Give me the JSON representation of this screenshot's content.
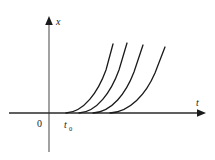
{
  "figure": {
    "title": "",
    "background_color": "#ffffff",
    "axis_color": "#7a7a7a",
    "curve_color": "#1a1a1a",
    "label_color": "#1a1a1a"
  },
  "axes": {
    "vertical": {
      "name": "x-axis",
      "label": "x",
      "arrow": "up-arrow-icon",
      "x_px": 49,
      "y_top_px": 18,
      "y_bottom_px": 152
    },
    "horizontal": {
      "name": "t-axis",
      "label": "t",
      "arrow": "right-arrow-icon",
      "y_px": 113,
      "x_left_px": 9,
      "x_right_px": 205
    },
    "origin": {
      "label": "0",
      "x_px": 40,
      "y_px": 126
    },
    "marker": {
      "label": "t",
      "subscript": "0",
      "x_px": 66,
      "y_px": 127
    }
  },
  "chart_data": {
    "type": "line",
    "title": "",
    "xlabel": "t",
    "ylabel": "x",
    "grid": false,
    "legend": null,
    "xlim": [
      0,
      10
    ],
    "ylim": [
      0,
      10
    ],
    "annotations": [
      {
        "text": "0",
        "role": "origin"
      },
      {
        "text": "t0",
        "role": "threshold-time"
      }
    ],
    "series": [
      {
        "name": "curve-1",
        "start_t_px": 66,
        "path": "M 66,113 C 84,112 98,92 106,70 L 113,44"
      },
      {
        "name": "curve-2",
        "start_t_px": 79,
        "path": "M 79,113 C 97,112 111,92 119,70 L 127,43"
      },
      {
        "name": "curve-3",
        "start_t_px": 93,
        "path": "M 93,113 C 112,112 126,93 134,72 L 143,45"
      },
      {
        "name": "curve-4",
        "start_t_px": 110,
        "path": "M 110,113 C 130,112 146,94 155,73 L 165,47"
      }
    ]
  }
}
